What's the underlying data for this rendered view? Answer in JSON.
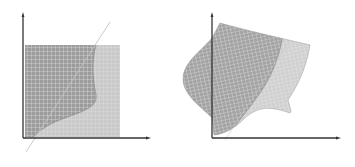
{
  "figure": {
    "panels": [
      {
        "id": "left",
        "description": "Rectangular grid region split by a curved boundary and a diagonal line",
        "colors": {
          "dark_region": "#9a9a9a",
          "light_region": "#c8c8c8",
          "grid": "#e6e6e6",
          "axis": "#333333",
          "line": "#bdbdbd"
        }
      },
      {
        "id": "right",
        "description": "Warped (transformed) grid region split by a curved boundary",
        "colors": {
          "dark_region": "#a0a0a0",
          "light_region": "#cfcfcf",
          "grid": "#ececec",
          "axis": "#333333",
          "line": "#bdbdbd"
        }
      }
    ]
  }
}
